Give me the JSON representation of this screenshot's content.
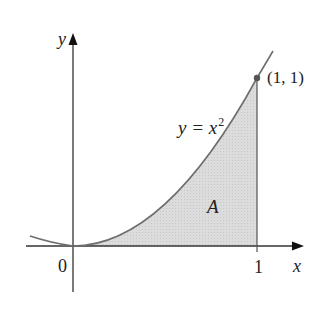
{
  "diagram": {
    "axes": {
      "x_label": "x",
      "y_label": "y",
      "origin_label": "0",
      "x_tick_label": "1"
    },
    "curve": {
      "equation_lhs": "y = x",
      "equation_exponent": "2",
      "color": "#6e6e6e"
    },
    "point": {
      "label": "(1, 1)",
      "color": "#555555"
    },
    "region": {
      "label": "A",
      "fill": "#d9d9d9"
    }
  }
}
